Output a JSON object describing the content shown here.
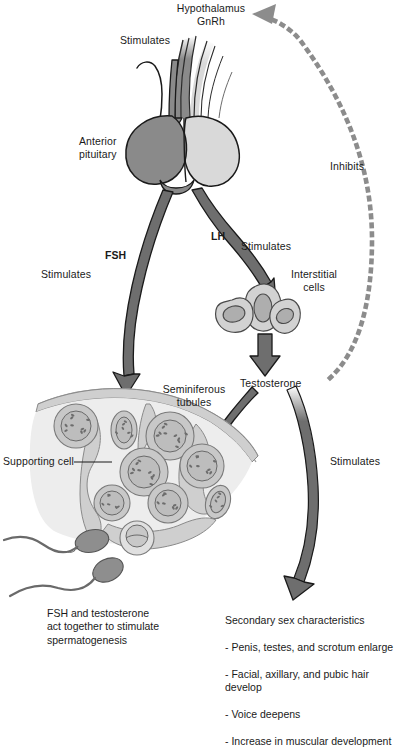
{
  "figure": {
    "palette": {
      "arrow_dark": "#6e6e6e",
      "arrow_stroke": "#1a1a1a",
      "anterior_pituitary": "#8a8a8a",
      "posterior_pituitary": "#d9d9d9",
      "tissue_light": "#cfcfcf",
      "tissue_pale": "#e4e4e4",
      "cell_fill": "#c8c8c8",
      "nucleus_fill": "#b4b4b4",
      "sperm_head": "#8e8e8e",
      "dotted_feedback": "#8c8c8c",
      "text": "#1a1a1a",
      "background": "#ffffff"
    }
  },
  "labels": {
    "hypothalamus": "Hypothalamus\nGnRh",
    "stimulates_top": "Stimulates",
    "anterior_pituitary": "Anterior\npituitary",
    "inhibits": "Inhibits",
    "fsh": "FSH",
    "lh": "LH",
    "stimulates_fsh": "Stimulates",
    "stimulates_lh": "Stimulates",
    "interstitial_cells": "Interstitial\ncells",
    "testosterone": "Testosterone",
    "seminiferous_tubules": "Seminiferous\ntubules",
    "supporting_cell": "Supporting cell",
    "stimulates_secondary": "Stimulates"
  },
  "captions": {
    "left": "FSH and testosterone\nact together to stimulate\nspermatogenesis",
    "right_title": "Secondary sex characteristics",
    "right_items": [
      "- Penis, testes, and scrotum enlarge",
      "- Facial, axillary, and pubic hair develop",
      "- Voice deepens",
      "- Increase in muscular development"
    ]
  },
  "icons": {
    "arrow_stimulates_top": "down-arrow-icon",
    "arrow_fsh": "curved-down-arrow-icon",
    "arrow_lh": "curved-down-arrow-icon",
    "arrow_testosterone": "down-arrow-icon",
    "arrow_to_tubules": "diagonal-arrow-icon",
    "arrow_secondary": "long-curved-arrow-icon",
    "feedback_loop": "dotted-feedback-arrow-icon"
  }
}
